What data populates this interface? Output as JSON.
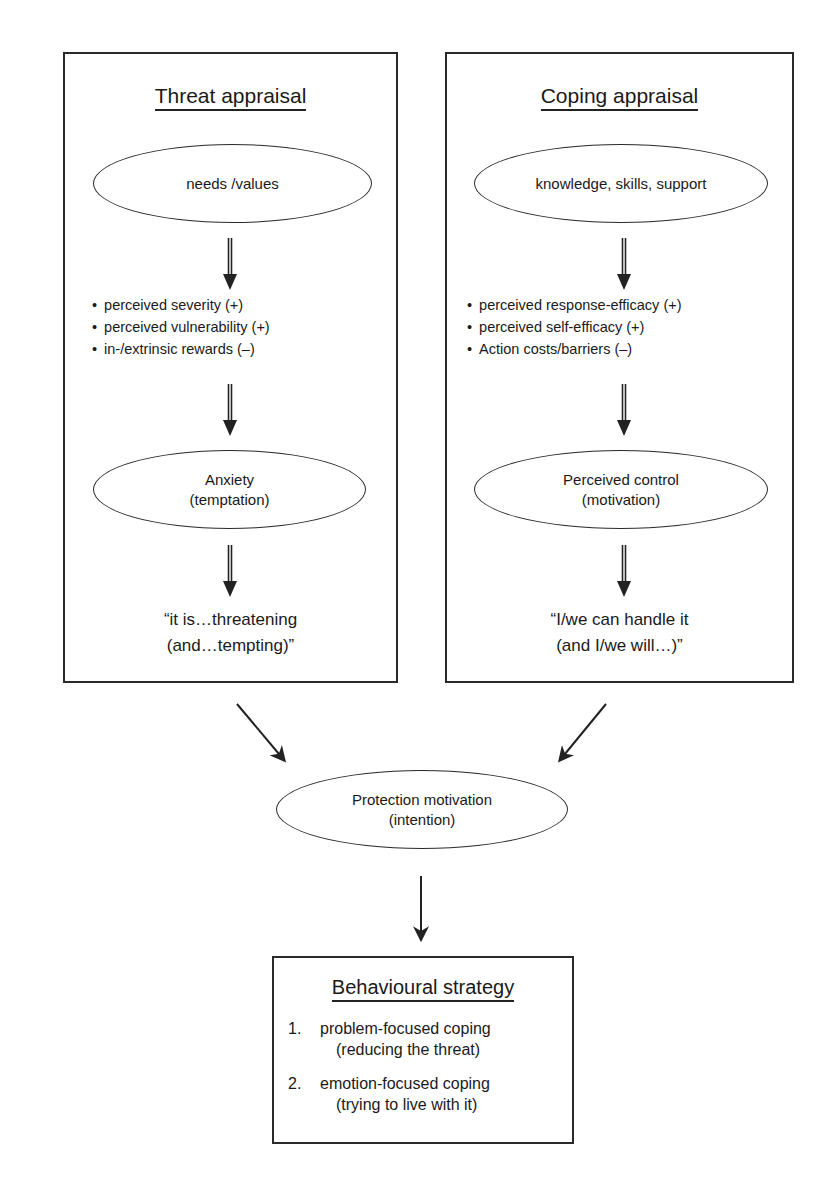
{
  "diagram": {
    "threat_appraisal": {
      "title": "Threat appraisal",
      "source_node": "needs /values",
      "factors": [
        "perceived severity (+)",
        "perceived vulnerability (+)",
        "in-/extrinsic rewards (–)"
      ],
      "emotion_node": {
        "line1": "Anxiety",
        "line2": "(temptation)"
      },
      "appraisal_quote": {
        "line1": "“it is…threatening",
        "line2": "(and…tempting)”"
      }
    },
    "coping_appraisal": {
      "title": "Coping appraisal",
      "source_node": "knowledge, skills, support",
      "factors": [
        "perceived response-efficacy (+)",
        "perceived self-efficacy (+)",
        "Action costs/barriers (–)"
      ],
      "emotion_node": {
        "line1": "Perceived control",
        "line2": "(motivation)"
      },
      "appraisal_quote": {
        "line1": "“I/we can handle it",
        "line2": "(and I/we will…)”"
      }
    },
    "protection_motivation": {
      "line1": "Protection motivation",
      "line2": "(intention)"
    },
    "behavioural_strategy": {
      "title": "Behavioural strategy",
      "items": [
        {
          "num": "1.",
          "line1": "problem-focused coping",
          "line2": "(reducing the threat)"
        },
        {
          "num": "2.",
          "line1": "emotion-focused coping",
          "line2": "(trying to live with it)"
        }
      ]
    },
    "icons": {
      "double_arrow": "double-line-down-arrow-icon",
      "diagonal_arrow": "diagonal-arrow-icon",
      "down_arrow": "down-arrow-icon"
    },
    "colors": {
      "stroke": "#2a2a2a",
      "background": "#ffffff",
      "text": "#1a1a1a"
    }
  }
}
